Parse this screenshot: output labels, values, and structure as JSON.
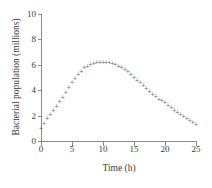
{
  "chart_data": {
    "type": "scatter",
    "title": "",
    "xlabel": "Time (h)",
    "ylabel": "Bacterial population (millions)",
    "xlim": [
      0,
      25
    ],
    "ylim": [
      0,
      10
    ],
    "xticks": [
      0,
      5,
      10,
      15,
      20,
      25
    ],
    "yticks": [
      0,
      2,
      4,
      6,
      8,
      10
    ],
    "grid": false,
    "legend": null,
    "marker": "+",
    "marker_color": "#6e6e7a",
    "axis_color": "#8a8a8a",
    "x": [
      0,
      0.5,
      1,
      1.5,
      2,
      2.5,
      3,
      3.5,
      4,
      4.5,
      5,
      5.5,
      6,
      6.5,
      7,
      7.5,
      8,
      8.5,
      9,
      9.5,
      10,
      10.5,
      11,
      11.5,
      12,
      12.5,
      13,
      13.5,
      14,
      14.5,
      15,
      15.5,
      16,
      16.5,
      17,
      17.5,
      18,
      18.5,
      19,
      19.5,
      20,
      20.5,
      21,
      21.5,
      22,
      22.5,
      23,
      23.5,
      24,
      24.5,
      25
    ],
    "y": [
      1.0,
      1.35,
      1.75,
      2.1,
      2.4,
      2.75,
      3.1,
      3.45,
      3.85,
      4.2,
      4.6,
      4.95,
      5.25,
      5.5,
      5.75,
      5.9,
      6.0,
      6.1,
      6.15,
      6.2,
      6.2,
      6.2,
      6.15,
      6.1,
      6.0,
      5.9,
      5.75,
      5.6,
      5.45,
      5.25,
      5.0,
      4.8,
      4.6,
      4.35,
      4.1,
      3.9,
      3.7,
      3.5,
      3.3,
      3.15,
      3.0,
      2.8,
      2.6,
      2.4,
      2.25,
      2.1,
      1.9,
      1.75,
      1.6,
      1.45,
      1.3
    ]
  }
}
